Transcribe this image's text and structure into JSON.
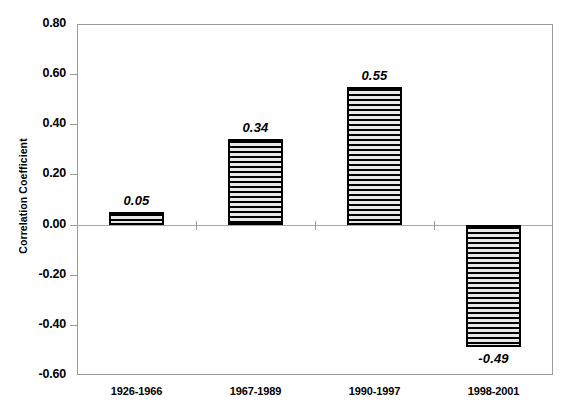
{
  "chart_data": {
    "type": "bar",
    "title": "",
    "xlabel": "",
    "ylabel": "Correlation Coefficient",
    "categories": [
      "1926-1966",
      "1967-1989",
      "1990-1997",
      "1998-2001"
    ],
    "values": [
      0.05,
      0.34,
      0.55,
      -0.49
    ],
    "value_labels": [
      "0.05",
      "0.34",
      "0.55",
      "-0.49"
    ],
    "ylim": [
      -0.6,
      0.8
    ],
    "ytick_values": [
      0.8,
      0.6,
      0.4,
      0.2,
      0.0,
      -0.2,
      -0.4,
      -0.6
    ],
    "ytick_labels": [
      "0.80",
      "0.60",
      "0.40",
      "0.20",
      "0.00",
      "-0.20",
      "-0.40",
      "-0.60"
    ],
    "grid": false,
    "legend": false,
    "bar_fill": "horizontal-stripe-hatch",
    "bar_border_color": "#000000",
    "plot_background": "#ffffff",
    "axis_color": "#9a9a9a"
  }
}
